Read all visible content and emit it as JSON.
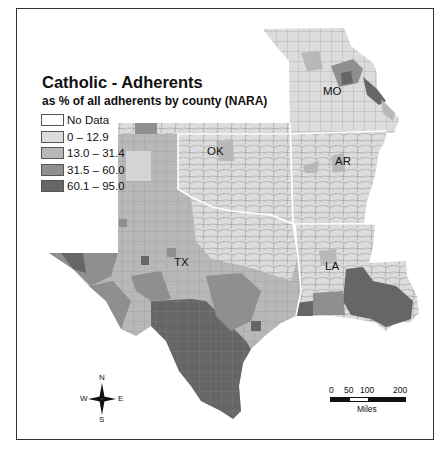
{
  "map": {
    "title": "Catholic - Adherents",
    "subtitle": "as % of all adherents by county (NARA)",
    "legend": [
      {
        "label": "No Data",
        "color": "#ffffff"
      },
      {
        "label": "0 – 12.9",
        "color": "#dcdcdc"
      },
      {
        "label": "13.0 – 31.4",
        "color": "#b8b8b8"
      },
      {
        "label": "31.5 – 60.0",
        "color": "#8f8f8f"
      },
      {
        "label": "60.1 – 95.0",
        "color": "#666666"
      }
    ],
    "states": [
      {
        "abbr": "MO",
        "label": "MO"
      },
      {
        "abbr": "OK",
        "label": "OK"
      },
      {
        "abbr": "AR",
        "label": "AR"
      },
      {
        "abbr": "TX",
        "label": "TX"
      },
      {
        "abbr": "LA",
        "label": "LA"
      }
    ],
    "compass": {
      "n": "N",
      "s": "S",
      "e": "E",
      "w": "W"
    },
    "scale_bar": {
      "ticks": [
        "0",
        "50",
        "100",
        "200"
      ],
      "units": "Miles"
    },
    "colors": {
      "state_border": "#ffffff",
      "county_border": "#8a8a8a",
      "frame": "#333333"
    }
  }
}
